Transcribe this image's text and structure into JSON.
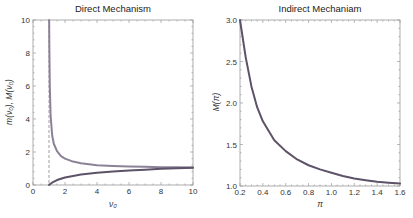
{
  "chart_data": [
    {
      "type": "line",
      "title": "Direct Mechanism",
      "xlabel": "ν₀",
      "ylabel": "m(ν₀), M(ν₀)",
      "xlim": [
        0,
        10
      ],
      "ylim": [
        0,
        10
      ],
      "xticks": [
        "0",
        "2",
        "4",
        "6",
        "8",
        "10"
      ],
      "yticks": [
        "0",
        "2",
        "4",
        "6",
        "8",
        "10"
      ],
      "grid": false,
      "annotations": [
        {
          "type": "dashed-vertical-line",
          "x": 1
        }
      ],
      "series": [
        {
          "name": "M(ν₀)",
          "color": "#8c8298",
          "x": [
            1.01,
            1.02,
            1.05,
            1.1,
            1.2,
            1.3,
            1.5,
            1.75,
            2,
            2.5,
            3,
            4,
            5,
            6,
            7,
            8,
            9,
            10
          ],
          "y": [
            10,
            8.5,
            6.0,
            4.2,
            3.0,
            2.5,
            2.05,
            1.75,
            1.6,
            1.42,
            1.32,
            1.2,
            1.15,
            1.12,
            1.1,
            1.08,
            1.07,
            1.06
          ]
        },
        {
          "name": "m(ν₀)",
          "color": "#5d5268",
          "x": [
            1,
            1.25,
            1.5,
            2,
            2.5,
            3,
            4,
            5,
            6,
            7,
            8,
            9,
            10
          ],
          "y": [
            0,
            0.18,
            0.3,
            0.45,
            0.55,
            0.63,
            0.74,
            0.82,
            0.88,
            0.93,
            0.98,
            1.02,
            1.05
          ]
        }
      ]
    },
    {
      "type": "line",
      "title": "Indirect Mechaniam",
      "xlabel": "π",
      "ylabel": "M(π)",
      "xlim": [
        0.2,
        1.6
      ],
      "ylim": [
        1.0,
        3.0
      ],
      "xticks": [
        "0.2",
        "0.4",
        "0.6",
        "0.8",
        "1.0",
        "1.2",
        "1.4",
        "1.6"
      ],
      "yticks": [
        "1.0",
        "1.5",
        "2.0",
        "2.5",
        "3.0"
      ],
      "grid": false,
      "series": [
        {
          "name": "M(π)",
          "color": "#5d5268",
          "x": [
            0.2,
            0.25,
            0.3,
            0.35,
            0.4,
            0.5,
            0.6,
            0.7,
            0.8,
            0.9,
            1.0,
            1.1,
            1.2,
            1.3,
            1.4,
            1.5,
            1.6
          ],
          "y": [
            3.0,
            2.55,
            2.2,
            1.95,
            1.78,
            1.55,
            1.42,
            1.32,
            1.25,
            1.2,
            1.16,
            1.12,
            1.09,
            1.07,
            1.05,
            1.04,
            1.03
          ]
        }
      ]
    }
  ]
}
